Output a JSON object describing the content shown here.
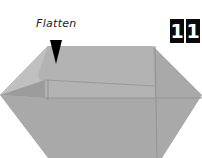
{
  "instruction": {
    "label": "Flatten",
    "step_digits": [
      "1",
      "1"
    ]
  },
  "colors": {
    "paper": "#a9a9a9",
    "paper_light": "#b4b4b4",
    "crease": "#8f8f8f",
    "arrow": "#000000",
    "step_box": "#0a0a0a"
  }
}
